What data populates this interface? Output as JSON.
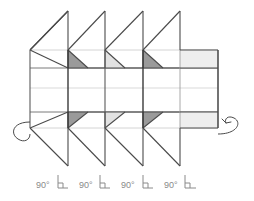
{
  "figure": {
    "kind": "technical-line-drawing"
  },
  "colors": {
    "stroke_dark": "#3a3a3a",
    "stroke_mid": "#6e6e6e",
    "stroke_light": "#c9c9c9",
    "fill_dark_triangle": "#9a9a9a",
    "fill_light_triangle": "#e2e2e2",
    "fill_panel_band": "#eeeeee",
    "label_text": "#8a8a8a",
    "background": "#ffffff"
  },
  "angle_labels": [
    {
      "id": "angle-1",
      "text": "90°",
      "x": 36,
      "y": 185
    },
    {
      "id": "angle-2",
      "text": "90°",
      "x": 79,
      "y": 185
    },
    {
      "id": "angle-3",
      "text": "90°",
      "x": 121,
      "y": 185
    },
    {
      "id": "angle-4",
      "text": "90°",
      "x": 164,
      "y": 185
    }
  ],
  "angle_marks": [
    {
      "id": "right-angle-mark-1",
      "x": 58,
      "y": 178
    },
    {
      "id": "right-angle-mark-2",
      "x": 100,
      "y": 178
    },
    {
      "id": "right-angle-mark-3",
      "x": 143,
      "y": 178
    },
    {
      "id": "right-angle-mark-4",
      "x": 185,
      "y": 178
    }
  ],
  "geometry": {
    "horizontal_rules_y": [
      50,
      68,
      88,
      112,
      128
    ],
    "vertical_folds_x": [
      30,
      68,
      105,
      143,
      180,
      218
    ],
    "body_top_y": 50,
    "body_bottom_y": 128,
    "mid_y": 88,
    "left_x": 30,
    "right_x": 218,
    "peak_top_y": 11,
    "peak_bottom_y": 166
  },
  "dark_triangles": [
    {
      "id": "dark-triangle-top-1",
      "points": "68,50 88,68 68,68"
    },
    {
      "id": "dark-triangle-top-2",
      "points": "143,50 163,68 143,68"
    },
    {
      "id": "dark-triangle-bottom-1",
      "points": "68,128 88,112 68,112"
    },
    {
      "id": "dark-triangle-bottom-2",
      "points": "143,128 163,112 143,112"
    }
  ],
  "light_triangles": [
    {
      "id": "light-triangle-top-1",
      "points": "105,50 125,68 105,68"
    },
    {
      "id": "light-triangle-bottom-1",
      "points": "105,128 125,112 105,112"
    }
  ],
  "panel_bands": [
    {
      "id": "panel-band-top",
      "x": 180,
      "y": 50,
      "w": 38,
      "h": 18
    },
    {
      "id": "panel-band-bottom",
      "x": 180,
      "y": 112,
      "w": 38,
      "h": 16
    }
  ],
  "rotation_arrows": [
    {
      "id": "rotation-arrow-left",
      "side": "left",
      "has_head": false
    },
    {
      "id": "rotation-arrow-right",
      "side": "right",
      "has_head": true
    }
  ]
}
